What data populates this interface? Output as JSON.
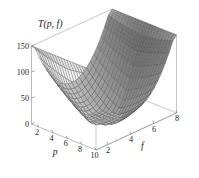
{
  "figure": {
    "background_color": "#ffffff",
    "line_color": "#4a4a4a",
    "axis_color": "#8a8a8a",
    "text_color": "#1a1a1a"
  },
  "chart_data": {
    "type": "surface",
    "title": "T(p, f)",
    "subtitle": "",
    "render_style": "wireframe-mesh",
    "grid": false,
    "legend": null,
    "xlabel": "p",
    "ylabel": "f",
    "zlabel": "T(p, f)",
    "xlim": [
      1,
      10
    ],
    "ylim": [
      1,
      8
    ],
    "zlim": [
      0,
      150
    ],
    "xticks": [
      2,
      4,
      6,
      8,
      10
    ],
    "xtick_labels": [
      "2",
      "4",
      "6",
      "8",
      "10"
    ],
    "yticks": [
      2,
      4,
      6,
      8
    ],
    "ytick_labels": [
      "2",
      "4",
      "6",
      "8"
    ],
    "zticks": [
      0,
      50,
      100,
      150
    ],
    "ztick_labels": [
      "0",
      "50",
      "100",
      "150"
    ],
    "mesh_resolution": {
      "p_steps": 22,
      "f_steps": 22
    },
    "surface_description": "Saddle-shaped surface: valley running diagonally with two raised ridges at opposing corners",
    "z_range_observed": [
      0,
      150
    ],
    "sample_points": [
      {
        "p": 1,
        "f": 1,
        "z": 118
      },
      {
        "p": 1,
        "f": 4.5,
        "z": 40
      },
      {
        "p": 1,
        "f": 8,
        "z": 120
      },
      {
        "p": 5.5,
        "f": 1,
        "z": 132
      },
      {
        "p": 5.5,
        "f": 4.5,
        "z": 18
      },
      {
        "p": 5.5,
        "f": 8,
        "z": 128
      },
      {
        "p": 10,
        "f": 1,
        "z": 112
      },
      {
        "p": 10,
        "f": 4.5,
        "z": 35
      },
      {
        "p": 10,
        "f": 8,
        "z": 118
      }
    ]
  }
}
